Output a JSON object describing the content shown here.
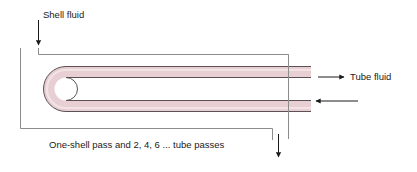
{
  "diagram": {
    "caption": "One-shell pass and 2, 4, 6 ... tube passes",
    "labels": {
      "shell_fluid": "Shell fluid",
      "tube_fluid": "Tube fluid"
    },
    "colors": {
      "tube_fill": "#e9d2d5",
      "tube_fill_light": "#f2e2e4",
      "tube_outline": "#4a4246",
      "shell_outline": "#8c8c8c",
      "arrow": "#1a1a1a",
      "text": "#1a1a1a",
      "background": "#ffffff"
    },
    "flows": [
      {
        "name": "shell-fluid-inlet",
        "direction": "down",
        "label": "Shell fluid"
      },
      {
        "name": "shell-fluid-outlet",
        "direction": "down",
        "label": ""
      },
      {
        "name": "tube-fluid-outlet",
        "direction": "right",
        "label": "Tube fluid"
      },
      {
        "name": "tube-fluid-inlet",
        "direction": "left",
        "label": ""
      }
    ],
    "geometry": {
      "shell_left_x": 20,
      "shell_top_y": 54,
      "shell_right_x": 288,
      "shell_bottom_y": 128,
      "tube_upper_y": 72,
      "tube_lower_y": 94,
      "tube_thickness": 10,
      "tube_right_x": 311
    }
  }
}
